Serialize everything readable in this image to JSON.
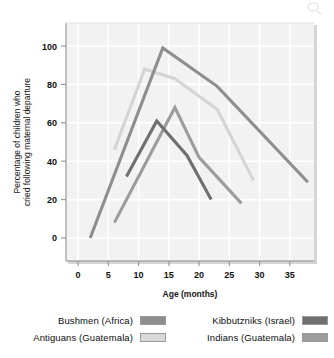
{
  "chart_data": {
    "type": "line",
    "title": "",
    "xlabel": "Age (months)",
    "ylabel": "Percentage of children who cried following maternal departure",
    "xlim": [
      -2,
      39
    ],
    "ylim": [
      -12,
      112
    ],
    "xticks": [
      0,
      5,
      10,
      15,
      20,
      25,
      30,
      35
    ],
    "yticks": [
      0,
      20,
      40,
      60,
      80,
      100
    ],
    "grid": true,
    "legend_position": "below-plot",
    "series": [
      {
        "name": "Bushmen (Africa)",
        "color": "#8e8e8e",
        "points": [
          [
            2,
            0
          ],
          [
            14,
            99
          ],
          [
            23,
            79
          ],
          [
            38,
            29
          ]
        ]
      },
      {
        "name": "Antiguans (Guatemala)",
        "color": "#d4d4d4",
        "points": [
          [
            6,
            46
          ],
          [
            11,
            88
          ],
          [
            16,
            83
          ],
          [
            23,
            67
          ],
          [
            29,
            30
          ]
        ]
      },
      {
        "name": "Kibbutzniks (Israel)",
        "color": "#6f6f6f",
        "points": [
          [
            8,
            32
          ],
          [
            13,
            61
          ],
          [
            18,
            43
          ],
          [
            22,
            20
          ]
        ]
      },
      {
        "name": "Indians (Guatemala)",
        "color": "#9c9c9c",
        "points": [
          [
            6,
            8
          ],
          [
            16,
            68
          ],
          [
            20,
            42
          ],
          [
            27,
            18
          ]
        ]
      }
    ]
  },
  "axes": {
    "x_label": "Age (months)",
    "y_label_line1": "Percentage of children who",
    "y_label_line2": "cried following maternal departure",
    "x_tick_labels": [
      "0",
      "5",
      "10",
      "15",
      "20",
      "25",
      "30",
      "35"
    ],
    "y_tick_labels": [
      "0",
      "20",
      "40",
      "60",
      "80",
      "100"
    ]
  },
  "legend": {
    "left_column": [
      {
        "label": "Bushmen (Africa)",
        "color": "#8e8e8e"
      },
      {
        "label": "Antiguans (Guatemala)",
        "color": "#d8d8d8"
      }
    ],
    "right_column": [
      {
        "label": "Kibbutzniks (Israel)",
        "color": "#6f6f6f"
      },
      {
        "label": "Indians (Guatemala)",
        "color": "#9c9c9c"
      }
    ]
  },
  "colors": {
    "plot_background": "#f2f2f2",
    "gridline": "#ffffff",
    "axis_line": "#a8a8a8",
    "text": "#111111"
  }
}
